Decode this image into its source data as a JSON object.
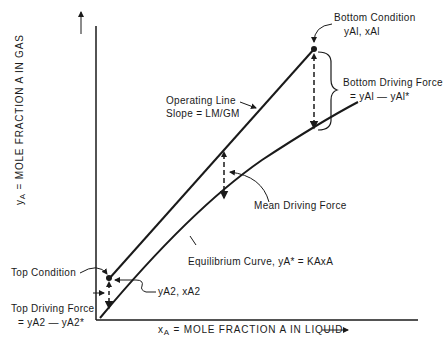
{
  "diagram": {
    "type": "absorption operating line vs equilibrium curve",
    "axes": {
      "x_label_var": "x",
      "x_label_sub": "A",
      "x_label_text": " = MOLE FRACTION A IN LIQUID",
      "y_label_var": "y",
      "y_label_sub": "A",
      "y_label_text": " = MOLE FRACTION A IN GAS"
    },
    "labels": {
      "bottom_condition_title": "Bottom Condition",
      "bottom_condition_vals": "yAl, xAl",
      "bottom_driving_force_title": "Bottom Driving Force",
      "bottom_driving_force_eq": "= yAl — yAl*",
      "operating_line_title": "Operating Line",
      "operating_line_slope": "Slope = LM/GM",
      "mean_driving_force": "Mean Driving Force",
      "equilibrium_curve": "Equilibrium Curve, yA* = KAxA",
      "top_condition": "Top Condition",
      "top_point_vals": "yA2, xA2",
      "top_driving_force_title": "Top Driving Force",
      "top_driving_force_eq": "= yA2 — yA2*"
    },
    "colors": {
      "line": "#1a1a1a",
      "background": "#ffffff"
    }
  }
}
